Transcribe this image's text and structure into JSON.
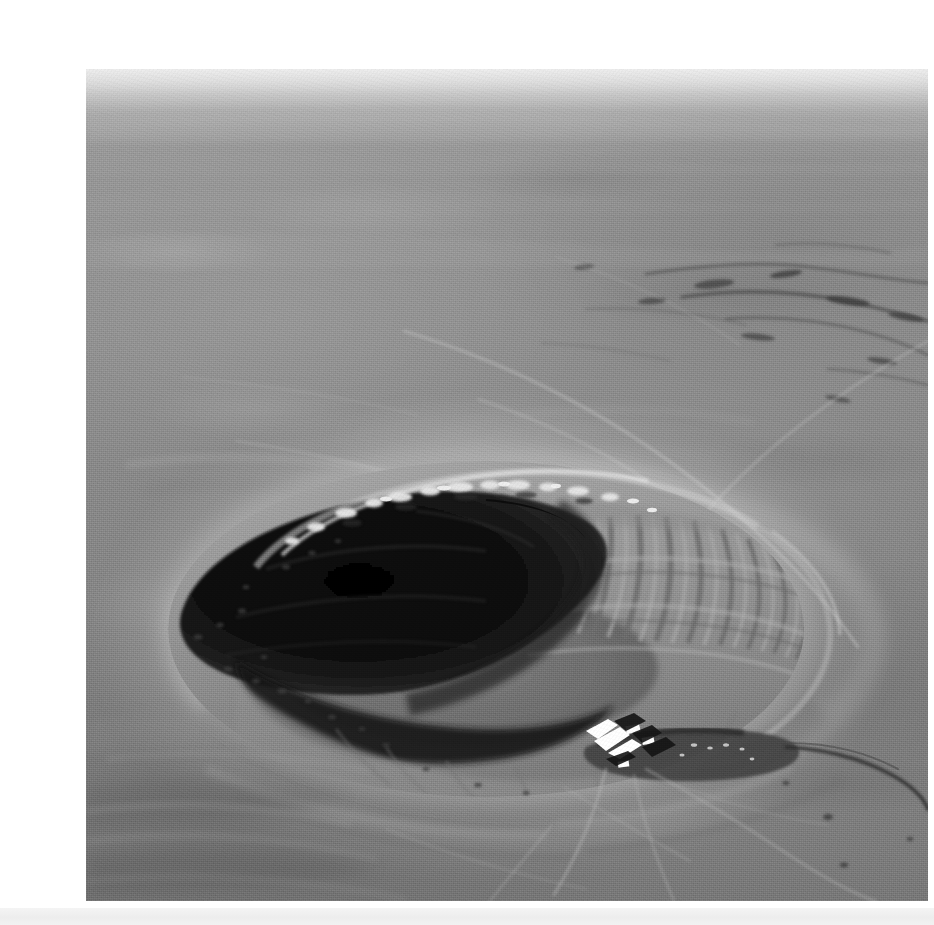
{
  "page": {
    "background_color": "#ffffff",
    "width": 934,
    "height": 925,
    "bottom_strip_color": "#eeeeee"
  },
  "photo": {
    "alt_text": "Aerial black-and-white photograph of a large circular impact crater in a flat desert plain",
    "subject": "impact crater",
    "view": "oblique aerial view",
    "color_mode": "black-and-white",
    "frame": {
      "x": 46,
      "y": 53,
      "width": 842,
      "height": 832
    },
    "palette": {
      "sky_haze": "#dcdcdc",
      "far_plain": "#9c9c9c",
      "near_plain": "#7e7e7e",
      "rim_highlight": "#e8e8e8",
      "crater_shadow": "#0d0d0d",
      "inner_wall": "#8f8f8f",
      "building_roof": "#ffffff",
      "road_dark": "#3a3a3a"
    },
    "features": [
      {
        "name": "horizon",
        "label": "Horizon"
      },
      {
        "name": "desert-plain",
        "label": "Desert plain"
      },
      {
        "name": "crater-rim",
        "label": "Crater rim"
      },
      {
        "name": "crater-shadow",
        "label": "Shadowed crater wall"
      },
      {
        "name": "crater-floor",
        "label": "Crater floor"
      },
      {
        "name": "inner-wall-gullies",
        "label": "Radial gullies on inner wall"
      },
      {
        "name": "ejecta-blanket",
        "label": "Ejecta blanket"
      },
      {
        "name": "visitor-center",
        "label": "Visitor center buildings"
      },
      {
        "name": "parking-lot",
        "label": "Parking lot"
      },
      {
        "name": "access-road",
        "label": "Access road"
      },
      {
        "name": "drainage-channels",
        "label": "Drainage channels"
      },
      {
        "name": "dirt-tracks",
        "label": "Dirt tracks"
      }
    ]
  }
}
